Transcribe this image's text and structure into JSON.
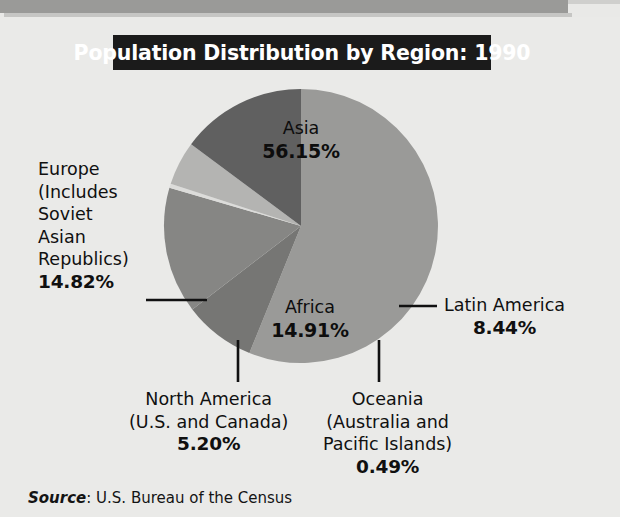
{
  "title": {
    "text": "Population Distribution by Region: 1990",
    "background": "#1b1b1b",
    "color": "#ffffff"
  },
  "source": {
    "label": "Source",
    "separator": ": ",
    "value": "U.S. Bureau of the Census"
  },
  "labels": {
    "asia": {
      "name": "Asia",
      "pct": "56.15%"
    },
    "africa": {
      "name": "Africa",
      "pct": "14.91%"
    },
    "europe": {
      "line1": "Europe",
      "line2": "(Includes",
      "line3": "Soviet",
      "line4": "Asian",
      "line5": "Republics)",
      "pct": "14.82%"
    },
    "latin": {
      "line1": "Latin America",
      "pct": "8.44%"
    },
    "north": {
      "line1": "North America",
      "line2": "(U.S. and Canada)",
      "pct": "5.20%"
    },
    "oceania": {
      "line1": "Oceania",
      "line2": "(Australia and",
      "line3": "Pacific Islands)",
      "pct": "0.49%"
    }
  },
  "chart_data": {
    "type": "pie",
    "title": "Population Distribution by Region: 1990",
    "source": "Source: U.S. Bureau of the Census",
    "units": "percent of world population",
    "legend": "none (direct labels)",
    "start_angle_deg": 0,
    "direction": "clockwise",
    "center": {
      "x": 301,
      "y": 226
    },
    "radius": 137,
    "categories": [
      "Asia",
      "Latin America",
      "Africa",
      "Oceania (Australia and Pacific Islands)",
      "North America (U.S. and Canada)",
      "Europe (Includes Soviet Asian Republics)"
    ],
    "values": [
      56.15,
      8.44,
      14.91,
      0.49,
      5.2,
      14.82
    ],
    "slices": [
      {
        "label": "Asia",
        "value": 56.15,
        "color": "#9a9a98",
        "label_position": "inside"
      },
      {
        "label": "Latin America",
        "value": 8.44,
        "color": "#767674",
        "label_position": "outside-right"
      },
      {
        "label": "Africa",
        "value": 14.91,
        "color": "#868684",
        "label_position": "inside"
      },
      {
        "label": "Oceania",
        "value": 0.49,
        "color": "#dcdcda",
        "label_position": "outside-bottom"
      },
      {
        "label": "North America",
        "value": 5.2,
        "color": "#b4b4b2",
        "label_position": "outside-bottom"
      },
      {
        "label": "Europe",
        "value": 14.82,
        "color": "#606060",
        "label_position": "outside-left"
      }
    ],
    "total": 100.01
  },
  "colors": {
    "background": "#eaeae8",
    "top_bar": "#9a9a98",
    "leader_line": "#111111",
    "text": "#101010"
  }
}
